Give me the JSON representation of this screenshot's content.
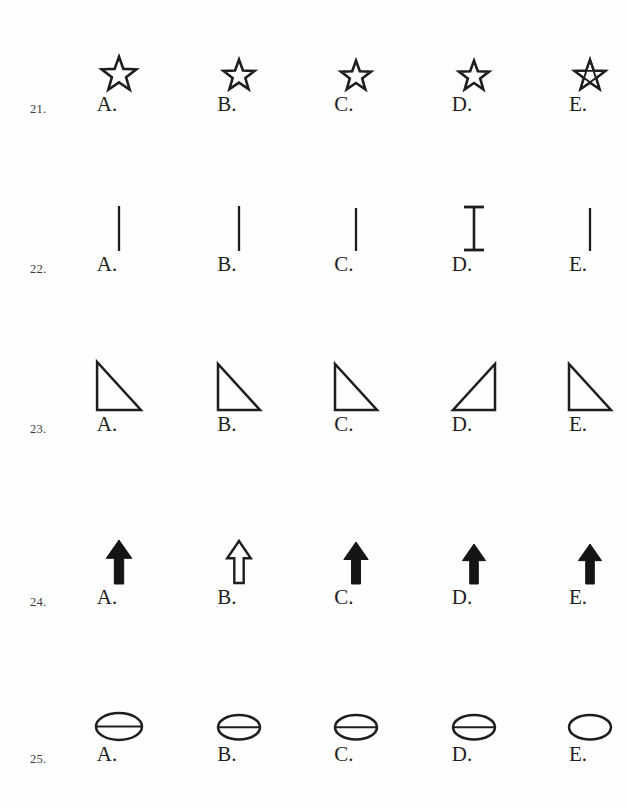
{
  "page": {
    "ink_color": "#1e1e1e",
    "paper_color": "#fefefe"
  },
  "option_letters": [
    "A.",
    "B.",
    "C.",
    "D.",
    "E."
  ],
  "questions": [
    {
      "number": "21.",
      "shape_family": "star",
      "options": [
        {
          "letter": "A.",
          "shape": "star-outline",
          "size": 38,
          "note": "five-point outline star"
        },
        {
          "letter": "B.",
          "shape": "star-outline",
          "size": 34,
          "note": "five-point outline star"
        },
        {
          "letter": "C.",
          "shape": "star-outline",
          "size": 33,
          "note": "five-point outline star"
        },
        {
          "letter": "D.",
          "shape": "star-outline",
          "size": 33,
          "note": "five-point outline star"
        },
        {
          "letter": "E.",
          "shape": "star-pentagram",
          "size": 34,
          "note": "star with internal crossing lines"
        }
      ]
    },
    {
      "number": "22.",
      "shape_family": "vertical-line",
      "options": [
        {
          "letter": "A.",
          "shape": "line-plain",
          "size": 47,
          "note": "plain vertical line"
        },
        {
          "letter": "B.",
          "shape": "line-plain",
          "size": 47,
          "note": "plain vertical line"
        },
        {
          "letter": "C.",
          "shape": "line-plain",
          "size": 45,
          "note": "plain vertical line"
        },
        {
          "letter": "D.",
          "shape": "line-serif",
          "size": 47,
          "note": "vertical line with horizontal caps top and bottom"
        },
        {
          "letter": "E.",
          "shape": "line-plain",
          "size": 45,
          "note": "plain vertical line"
        }
      ]
    },
    {
      "number": "23.",
      "shape_family": "right-triangle",
      "options": [
        {
          "letter": "A.",
          "shape": "triangle-left",
          "size": 52,
          "note": "right angle at bottom-left"
        },
        {
          "letter": "B.",
          "shape": "triangle-left",
          "size": 50,
          "note": "right angle at bottom-left"
        },
        {
          "letter": "C.",
          "shape": "triangle-left",
          "size": 50,
          "note": "right angle at bottom-left"
        },
        {
          "letter": "D.",
          "shape": "triangle-right",
          "size": 50,
          "note": "mirrored - right angle at bottom-right"
        },
        {
          "letter": "E.",
          "shape": "triangle-left",
          "size": 50,
          "note": "right angle at bottom-left"
        }
      ]
    },
    {
      "number": "24.",
      "shape_family": "up-arrow",
      "options": [
        {
          "letter": "A.",
          "shape": "arrow-filled",
          "size": 46,
          "note": "solid black up arrow"
        },
        {
          "letter": "B.",
          "shape": "arrow-hollow",
          "size": 46,
          "note": "white outlined up arrow"
        },
        {
          "letter": "C.",
          "shape": "arrow-filled",
          "size": 44,
          "note": "solid black up arrow"
        },
        {
          "letter": "D.",
          "shape": "arrow-filled",
          "size": 42,
          "note": "solid black up arrow"
        },
        {
          "letter": "E.",
          "shape": "arrow-filled",
          "size": 42,
          "note": "solid black up arrow"
        }
      ]
    },
    {
      "number": "25.",
      "shape_family": "ellipse",
      "options": [
        {
          "letter": "A.",
          "shape": "ellipse-barred",
          "size": 50,
          "note": "ellipse with horizontal line through centre"
        },
        {
          "letter": "B.",
          "shape": "ellipse-barred",
          "size": 46,
          "note": "ellipse with horizontal line through centre"
        },
        {
          "letter": "C.",
          "shape": "ellipse-barred",
          "size": 46,
          "note": "ellipse with horizontal line through centre"
        },
        {
          "letter": "D.",
          "shape": "ellipse-barred",
          "size": 46,
          "note": "ellipse with horizontal line through centre"
        },
        {
          "letter": "E.",
          "shape": "ellipse-plain",
          "size": 46,
          "note": "plain ellipse, no line"
        }
      ]
    }
  ]
}
